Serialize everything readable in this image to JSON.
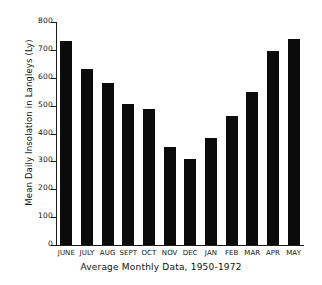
{
  "chart_data": {
    "type": "bar",
    "title": "",
    "subtitle": "",
    "xlabel": "Average Monthly Data, 1950-1972",
    "ylabel": "Mean Daily Insolation in Langleys (Ly)",
    "categories": [
      "JUNE",
      "JULY",
      "AUG",
      "SEPT",
      "OCT",
      "NOV",
      "DEC",
      "JAN",
      "FEB",
      "MAR",
      "APR",
      "MAY"
    ],
    "values": [
      731,
      630,
      580,
      505,
      487,
      350,
      310,
      385,
      463,
      548,
      695,
      740
    ],
    "ylim": [
      0,
      800
    ],
    "yticks": [
      0,
      100,
      200,
      300,
      400,
      500,
      600,
      700,
      800
    ],
    "ytick_labels": [
      "0",
      "100",
      "200",
      "300",
      "400",
      "500",
      "600",
      "700",
      "800"
    ],
    "grid": false,
    "legend": null,
    "bar_color": "#0b0b0b",
    "axis_color": "#1a1a1a",
    "background_color": "#ffffff"
  }
}
